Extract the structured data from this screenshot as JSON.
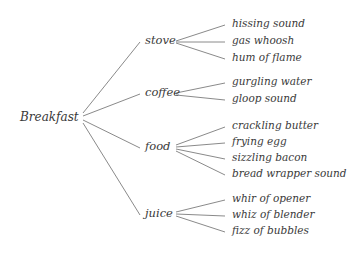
{
  "diagram": {
    "type": "mind-map",
    "root": {
      "label": "Breakfast"
    },
    "line_color": "#8a8a8a",
    "text_color": "#3a3a3a",
    "branches": [
      {
        "label": "stove",
        "children": [
          "hissing sound",
          "gas whoosh",
          "hum of flame"
        ]
      },
      {
        "label": "coffee",
        "children": [
          "gurgling water",
          "gloop sound"
        ]
      },
      {
        "label": "food",
        "children": [
          "crackling butter",
          "frying egg",
          "sizzling bacon",
          "bread wrapper sound"
        ]
      },
      {
        "label": "juice",
        "children": [
          "whir of opener",
          "whiz of blender",
          "fizz of bubbles"
        ]
      }
    ]
  }
}
